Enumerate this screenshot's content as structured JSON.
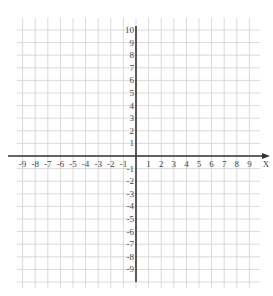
{
  "chart_data": {
    "type": "coordinate-grid",
    "title": "",
    "x_axis": {
      "label": "X",
      "min": -9,
      "max": 9,
      "tick_step": 1,
      "tick_labels": [
        "-9",
        "-8",
        "-7",
        "-6",
        "-5",
        "-4",
        "-3",
        "-2",
        "-1",
        "1",
        "2",
        "3",
        "4",
        "5",
        "6",
        "7",
        "8",
        "9"
      ]
    },
    "y_axis": {
      "label": "",
      "min": -9,
      "max": 10,
      "tick_step": 1,
      "tick_labels": [
        "10",
        "9",
        "8",
        "7",
        "6",
        "5",
        "4",
        "3",
        "2",
        "1",
        "-1",
        "-2",
        "-3",
        "-4",
        "-5",
        "-6",
        "-7",
        "-8",
        "-9"
      ]
    },
    "grid": true,
    "x_arrow": true,
    "data_points": []
  },
  "colors": {
    "grid": "#d0d0d0",
    "axis": "#333333",
    "label": "#444444"
  },
  "geometry": {
    "origin_x": 136,
    "origin_y": 156,
    "unit": 12.6,
    "grid_left": 17,
    "grid_right": 260,
    "grid_top": 18,
    "grid_bottom": 288
  }
}
